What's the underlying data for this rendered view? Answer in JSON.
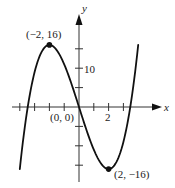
{
  "chart_data": {
    "type": "line",
    "title": "",
    "xlabel": "x",
    "ylabel": "y",
    "function": "x^3 - 12x",
    "xlim": [
      -4.5,
      5.5
    ],
    "ylim": [
      -18,
      22
    ],
    "grid": false,
    "x_ticks": [
      -4,
      -3,
      -2,
      -1,
      1,
      2,
      3
    ],
    "x_tick_labels": [
      {
        "value": 2,
        "label": "2"
      }
    ],
    "y_ticks": [
      -15,
      -10,
      -5,
      5,
      10,
      15
    ],
    "y_tick_labels": [
      {
        "value": 10,
        "label": "10"
      }
    ],
    "series": [
      {
        "name": "curve",
        "x": [
          -4,
          -3.5,
          -3,
          -2.5,
          -2,
          -1.5,
          -1,
          -0.5,
          0,
          0.5,
          1,
          1.5,
          2,
          2.5,
          3,
          3.5,
          4
        ],
        "y": [
          -16,
          -0.875,
          9,
          14.375,
          16,
          14.625,
          11,
          5.875,
          0,
          -5.875,
          -11,
          -14.625,
          -16,
          -14.375,
          -9,
          0.875,
          16
        ]
      }
    ],
    "points": [
      {
        "x": -2,
        "y": 16,
        "label": "(−2, 16)",
        "marker": true
      },
      {
        "x": 0,
        "y": 0,
        "label": "(0, 0)",
        "marker": false
      },
      {
        "x": 2,
        "y": -16,
        "label": "(2, −16)",
        "marker": true
      }
    ]
  },
  "labels": {
    "x_axis": "x",
    "y_axis": "y",
    "tick_2": "2",
    "tick_10": "10",
    "max_point": "(−2, 16)",
    "origin_point": "(0, 0)",
    "min_point": "(2, −16)"
  },
  "colors": {
    "curve": "#111111",
    "axis": "#333333",
    "text": "#222222"
  }
}
